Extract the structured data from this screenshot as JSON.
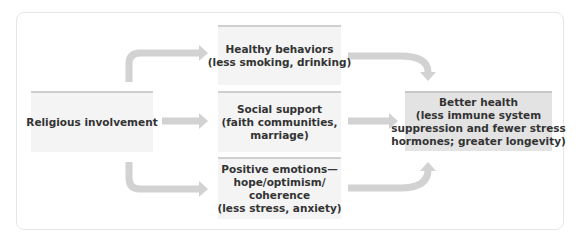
{
  "diagram": {
    "type": "flow",
    "colors": {
      "box_fill": "#f4f4f4",
      "result_fill": "#e3e3e3",
      "arrow": "#d2d2d2",
      "frame_border": "#e6e6e6",
      "text": "#333333"
    },
    "source": {
      "lines": [
        "Religious involvement"
      ]
    },
    "mediators": [
      {
        "id": "healthy-behaviors",
        "lines": [
          "Healthy behaviors",
          "(less smoking, drinking)"
        ]
      },
      {
        "id": "social-support",
        "lines": [
          "Social support",
          "(faith communities,",
          "marriage)"
        ]
      },
      {
        "id": "positive-emotions",
        "lines": [
          "Positive emotions—",
          "hope/optimism/",
          "coherence",
          "(less stress, anxiety)"
        ]
      }
    ],
    "outcome": {
      "lines": [
        "Better health",
        "(less immune system",
        "suppression and fewer stress",
        "hormones; greater longevity)"
      ]
    },
    "edges": [
      {
        "from": "source",
        "to": "healthy-behaviors"
      },
      {
        "from": "source",
        "to": "social-support"
      },
      {
        "from": "source",
        "to": "positive-emotions"
      },
      {
        "from": "healthy-behaviors",
        "to": "outcome"
      },
      {
        "from": "social-support",
        "to": "outcome"
      },
      {
        "from": "positive-emotions",
        "to": "outcome"
      }
    ]
  }
}
